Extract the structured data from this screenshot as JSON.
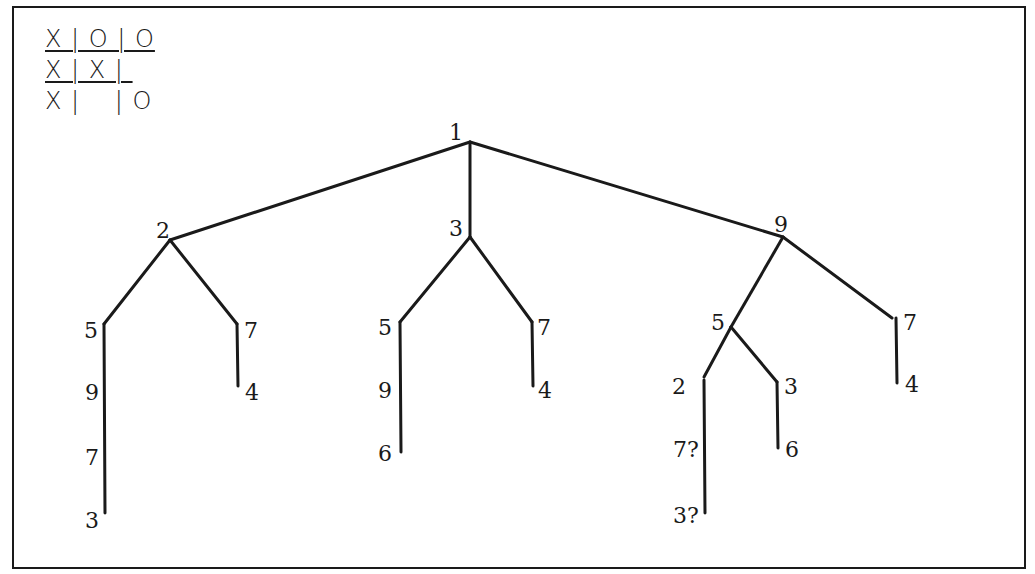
{
  "board": {
    "rows": [
      "X | O | O",
      "X | X | ",
      "X |    | O"
    ],
    "underlined_rows": [
      0,
      1
    ]
  },
  "tree": {
    "nodes": [
      {
        "id": "root",
        "label": "1",
        "x": 470,
        "y": 142,
        "lx": 449,
        "ly": 140
      },
      {
        "id": "n2",
        "label": "2",
        "x": 170,
        "y": 240,
        "lx": 156,
        "ly": 238
      },
      {
        "id": "n3",
        "label": "3",
        "x": 470,
        "y": 237,
        "lx": 449,
        "ly": 236
      },
      {
        "id": "n9",
        "label": "9",
        "x": 783,
        "y": 237,
        "lx": 774,
        "ly": 232
      },
      {
        "id": "n2_5",
        "label": "5",
        "x": 104,
        "y": 324,
        "lx": 84,
        "ly": 338
      },
      {
        "id": "n2_7",
        "label": "7",
        "x": 237,
        "y": 324,
        "lx": 244,
        "ly": 338
      },
      {
        "id": "n2_5_9",
        "label": "9",
        "x": 104,
        "y": 400,
        "lx": 85,
        "ly": 400
      },
      {
        "id": "n2_7_4",
        "label": "4",
        "x": 238,
        "y": 386,
        "lx": 245,
        "ly": 400
      },
      {
        "id": "n2_5_9_7",
        "label": "7",
        "x": 104,
        "y": 460,
        "lx": 85,
        "ly": 465
      },
      {
        "id": "n2_5_9_7_3",
        "label": "3",
        "x": 105,
        "y": 513,
        "lx": 85,
        "ly": 528
      },
      {
        "id": "n3_5",
        "label": "5",
        "x": 400,
        "y": 322,
        "lx": 378,
        "ly": 335
      },
      {
        "id": "n3_7",
        "label": "7",
        "x": 532,
        "y": 322,
        "lx": 537,
        "ly": 335
      },
      {
        "id": "n3_5_9",
        "label": "9",
        "x": 401,
        "y": 390,
        "lx": 378,
        "ly": 398
      },
      {
        "id": "n3_7_4",
        "label": "4",
        "x": 533,
        "y": 386,
        "lx": 538,
        "ly": 398
      },
      {
        "id": "n3_5_9_6",
        "label": "6",
        "x": 401,
        "y": 452,
        "lx": 378,
        "ly": 461
      },
      {
        "id": "n9_5",
        "label": "5",
        "x": 731,
        "y": 327,
        "lx": 711,
        "ly": 330
      },
      {
        "id": "n9_7",
        "label": "7",
        "x": 895,
        "y": 318,
        "lx": 903,
        "ly": 330
      },
      {
        "id": "n9_5_2",
        "label": "2",
        "x": 704,
        "y": 377,
        "lx": 672,
        "ly": 394
      },
      {
        "id": "n9_5_3",
        "label": "3",
        "x": 777,
        "y": 382,
        "lx": 784,
        "ly": 394
      },
      {
        "id": "n9_7_4",
        "label": "4",
        "x": 897,
        "y": 383,
        "lx": 905,
        "ly": 392
      },
      {
        "id": "n9_5_3_6",
        "label": "6",
        "x": 778,
        "y": 448,
        "lx": 785,
        "ly": 457
      },
      {
        "id": "n9_5_2_7q",
        "label": "7?",
        "x": 705,
        "y": 450,
        "lx": 673,
        "ly": 457
      },
      {
        "id": "n9_5_2_7q_3q",
        "label": "3?",
        "x": 705,
        "y": 513,
        "lx": 673,
        "ly": 523
      }
    ],
    "edges": [
      [
        470,
        142,
        170,
        240
      ],
      [
        470,
        142,
        470,
        237
      ],
      [
        470,
        142,
        783,
        237
      ],
      [
        170,
        240,
        104,
        324
      ],
      [
        170,
        240,
        237,
        324
      ],
      [
        104,
        324,
        105,
        513
      ],
      [
        237,
        324,
        238,
        386
      ],
      [
        470,
        237,
        400,
        322
      ],
      [
        470,
        237,
        532,
        322
      ],
      [
        400,
        322,
        401,
        452
      ],
      [
        532,
        322,
        533,
        386
      ],
      [
        783,
        237,
        731,
        327
      ],
      [
        783,
        237,
        892,
        318
      ],
      [
        896,
        318,
        897,
        383
      ],
      [
        731,
        327,
        704,
        377
      ],
      [
        731,
        327,
        777,
        382
      ],
      [
        704,
        380,
        705,
        513
      ],
      [
        777,
        382,
        778,
        448
      ]
    ]
  }
}
